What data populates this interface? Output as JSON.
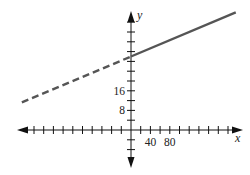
{
  "chart_data": {
    "type": "line",
    "title": "",
    "xlabel": "x",
    "ylabel": "y",
    "x_tick_labels": [
      {
        "value": 40,
        "label": "40"
      },
      {
        "value": 80,
        "label": "80"
      }
    ],
    "y_tick_labels": [
      {
        "value": 8,
        "label": "8"
      },
      {
        "value": 16,
        "label": "16"
      }
    ],
    "x_tick_step": 20,
    "y_tick_step": 4,
    "xlim": [
      -230,
      230
    ],
    "ylim": [
      -15,
      48
    ],
    "grid": false,
    "legend": null,
    "series": [
      {
        "name": "dashed segment (x < 0)",
        "style": "dashed",
        "color": "#555555",
        "x": [
          -225,
          0
        ],
        "y": [
          11.25,
          30
        ]
      },
      {
        "name": "solid segment (x >= 0)",
        "style": "solid",
        "color": "#555555",
        "x": [
          0,
          216
        ],
        "y": [
          30,
          48
        ]
      }
    ],
    "y_intercept": 30,
    "slope": 0.0833
  },
  "axes": {
    "x_name": "x",
    "y_name": "y",
    "color": "#111111"
  }
}
